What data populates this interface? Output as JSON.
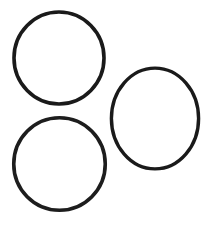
{
  "image": {
    "title": "Three overlapping-free circle outlines",
    "width": 202,
    "height": 230,
    "background_color": "#ffffff",
    "stroke_color": "#1a1a1a",
    "description": "Line drawing of three unfilled circles arranged two on the left stacked vertically and one on the right centered between them"
  },
  "shapes": [
    {
      "name": "circle-top-left",
      "type": "circle",
      "cx": 59,
      "cy": 58,
      "r": 45.5,
      "stroke_width": 3.6,
      "stroke_color": "#1a1a1a",
      "fill": "none",
      "label": "Top left circle"
    },
    {
      "name": "circle-bottom-left",
      "type": "circle",
      "cx": 59.5,
      "cy": 164,
      "r": 46,
      "stroke_width": 3.6,
      "stroke_color": "#1d1d1d",
      "fill": "none",
      "label": "Bottom left circle"
    },
    {
      "name": "circle-right",
      "type": "circle",
      "cx": 155,
      "cy": 118.5,
      "r": 47,
      "stroke_width": 3.4,
      "stroke_color": "#1a1a1a",
      "fill": "none",
      "label": "Right circle"
    }
  ]
}
